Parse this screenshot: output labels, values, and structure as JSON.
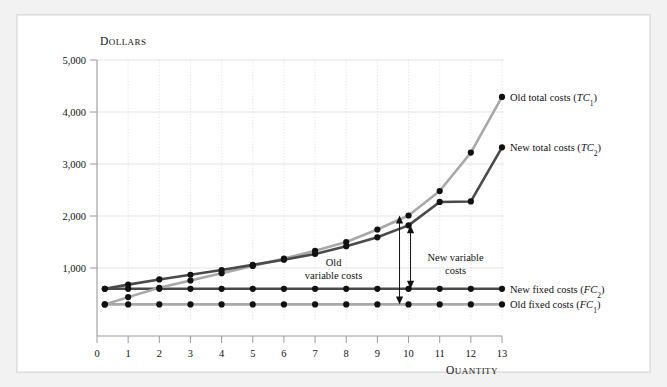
{
  "figure": {
    "background": "#f2f2f2",
    "panel_background": "#ffffff"
  },
  "chart_data": {
    "type": "line",
    "title": "",
    "xlabel": "Quantity",
    "ylabel": "Dollars",
    "xlim": [
      0,
      13
    ],
    "ylim": [
      0,
      5000
    ],
    "xticks": [
      "0",
      "1",
      "2",
      "3",
      "4",
      "5",
      "6",
      "7",
      "8",
      "9",
      "10",
      "11",
      "12",
      "13"
    ],
    "yticks": [
      "1,000",
      "2,000",
      "3,000",
      "4,000",
      "5,000"
    ],
    "grid": true,
    "legend_position": "right-inline",
    "x": [
      0.25,
      1,
      2,
      3,
      4,
      5,
      6,
      7,
      8,
      9,
      10,
      11,
      12,
      13
    ],
    "series": [
      {
        "name": "Old total costs (TC1)",
        "label_main": "Old total costs (",
        "label_italic": "TC",
        "label_sub": "1",
        "label_close": ")",
        "color": "#a8a8a8",
        "values": [
          300,
          440,
          620,
          760,
          900,
          1040,
          1180,
          1330,
          1500,
          1740,
          2010,
          2480,
          3220,
          4290
        ]
      },
      {
        "name": "New total costs (TC2)",
        "label_main": "New total costs (",
        "label_italic": "TC",
        "label_sub": "2",
        "label_close": ")",
        "color": "#4a4a4a",
        "values": [
          600,
          680,
          780,
          870,
          960,
          1060,
          1160,
          1270,
          1420,
          1590,
          1820,
          2270,
          2280,
          3320
        ]
      },
      {
        "name": "New fixed costs (FC2)",
        "label_main": "New fixed costs (",
        "label_italic": "FC",
        "label_sub": "2",
        "label_close": ")",
        "color": "#4a4a4a",
        "values": [
          600,
          600,
          600,
          600,
          600,
          600,
          600,
          600,
          600,
          600,
          600,
          600,
          600,
          600
        ]
      },
      {
        "name": "Old fixed costs (FC1)",
        "label_main": "Old fixed costs (",
        "label_italic": "FC",
        "label_sub": "1",
        "label_close": ")",
        "color": "#a8a8a8",
        "values": [
          300,
          300,
          300,
          300,
          300,
          300,
          300,
          300,
          300,
          300,
          300,
          300,
          300,
          300
        ]
      }
    ],
    "annotations": [
      {
        "name": "old-variable-costs",
        "line1": "Old",
        "line2": "variable costs",
        "at_x": 10,
        "span_from": 300,
        "span_to": 2010
      },
      {
        "name": "new-variable-costs",
        "line1": "New variable",
        "line2": "costs",
        "at_x": 10,
        "span_from": 600,
        "span_to": 1820
      }
    ]
  }
}
